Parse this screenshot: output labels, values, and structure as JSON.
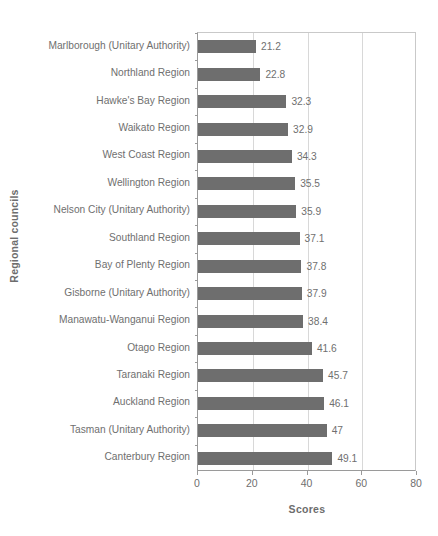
{
  "chart_data": {
    "type": "bar",
    "orientation": "horizontal",
    "title": "",
    "xlabel": "Scores",
    "ylabel": "Regional councils",
    "xlim": [
      0,
      80
    ],
    "xticks": [
      0,
      20,
      40,
      60,
      80
    ],
    "grid": true,
    "legend": null,
    "bar_color": "#6e6e6e",
    "text_color": "#6f6f6f",
    "axis_color": "#9a9a9a",
    "categories": [
      "Marlborough (Unitary Authority)",
      "Northland Region",
      "Hawke's Bay Region",
      "Waikato Region",
      "West Coast Region",
      "Wellington Region",
      "Nelson City (Unitary Authority)",
      "Southland Region",
      "Bay of Plenty Region",
      "Gisborne (Unitary Authority)",
      "Manawatu-Wanganui Region",
      "Otago Region",
      "Taranaki Region",
      "Auckland Region",
      "Tasman (Unitary Authority)",
      "Canterbury Region"
    ],
    "values": [
      21.2,
      22.8,
      32.3,
      32.9,
      34.3,
      35.5,
      35.9,
      37.1,
      37.8,
      37.9,
      38.4,
      41.6,
      45.7,
      46.1,
      47,
      49.1
    ],
    "value_labels": [
      "21.2",
      "22.8",
      "32.3",
      "32.9",
      "34.3",
      "35.5",
      "35.9",
      "37.1",
      "37.8",
      "37.9",
      "38.4",
      "41.6",
      "45.7",
      "46.1",
      "47",
      "49.1"
    ]
  }
}
